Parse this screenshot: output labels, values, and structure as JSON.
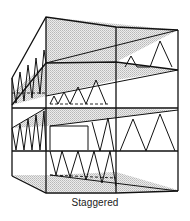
{
  "figure": {
    "caption": "Staggered",
    "colors": {
      "line": "#111111",
      "slab_fill": "#d9d9d9",
      "background": "#ffffff"
    },
    "components": [
      {
        "name": "floor-slab",
        "count": 5
      },
      {
        "name": "truss",
        "pattern": "staggered alternating floors"
      },
      {
        "name": "column-line",
        "count": 4
      }
    ]
  }
}
